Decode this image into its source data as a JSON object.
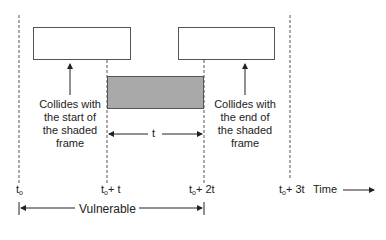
{
  "diagram": {
    "frames": [
      {
        "name": "earlier-frame",
        "x": 33,
        "y": 27,
        "w": 98,
        "h": 33,
        "shaded": false
      },
      {
        "name": "shaded-frame",
        "x": 107,
        "y": 76,
        "w": 97,
        "h": 33,
        "shaded": true
      },
      {
        "name": "later-frame",
        "x": 178,
        "y": 27,
        "w": 97,
        "h": 33,
        "shaded": false
      }
    ],
    "captions": {
      "left": [
        "Collides with",
        "the start of",
        "the shaded",
        "frame"
      ],
      "right": [
        "Collides with",
        "the end of",
        "the shaded",
        "frame"
      ]
    },
    "span_label": "t",
    "ticks": [
      {
        "base": "t",
        "sub": "o",
        "suffix": ""
      },
      {
        "base": "t",
        "sub": "o",
        "suffix": "+ t"
      },
      {
        "base": "t",
        "sub": "o",
        "suffix": "+ 2t"
      },
      {
        "base": "t",
        "sub": "o",
        "suffix": "+ 3t"
      }
    ],
    "time_label": "Time",
    "vulnerable_label": "Vulnerable",
    "colors": {
      "shaded_fill": "#a9a9a9",
      "line": "#555555"
    }
  }
}
